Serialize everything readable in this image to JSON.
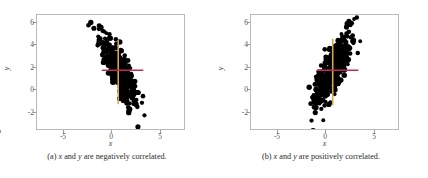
{
  "figure": {
    "panels": [
      {
        "tag": "(a)",
        "caption_pre": "(a) ",
        "caption_var1": "x",
        "caption_mid": " and ",
        "caption_var2": "y",
        "caption_post": " are negatively correlated.",
        "caption_full": "(a) x and y are negatively correlated.",
        "xlabel": "x",
        "ylabel": "y",
        "xticks": [
          "-5",
          "0",
          "5"
        ],
        "yticks": [
          "6",
          "4",
          "2",
          "0",
          "-2"
        ],
        "vline_color": "#d9a84e",
        "hline_color": "#c12b5a",
        "point_color": "#000000"
      },
      {
        "tag": "(b)",
        "caption_pre": "(b) ",
        "caption_var1": "x",
        "caption_mid": " and ",
        "caption_var2": "y",
        "caption_post": " are positively correlated.",
        "caption_full": "(b) x and y are positively correlated.",
        "xlabel": "x",
        "ylabel": "y",
        "xticks": [
          "-5",
          "0",
          "5"
        ],
        "yticks": [
          "6",
          "4",
          "2",
          "0",
          "-2"
        ],
        "vline_color": "#d9a84e",
        "hline_color": "#c12b5a",
        "point_color": "#000000"
      }
    ]
  },
  "chart_data": [
    {
      "type": "scatter",
      "title": "",
      "subtitle": "(a) x and y are negatively correlated.",
      "xlabel": "x",
      "ylabel": "y",
      "xlim": [
        -7.6,
        7.6
      ],
      "ylim": [
        -3.2,
        6.9
      ],
      "xticks": [
        -5,
        0,
        5
      ],
      "yticks": [
        -2,
        0,
        2,
        4,
        6
      ],
      "grid": false,
      "legend": "none",
      "correlation_sign": "negative",
      "approx_correlation": -0.75,
      "n_points": 420,
      "mean_x": 0.8,
      "mean_y": 2.0,
      "annotations": [
        {
          "kind": "vline",
          "x": 0.8,
          "y_from": -1.0,
          "y_to": 4.7,
          "color": "#d9a84e"
        },
        {
          "kind": "hline",
          "y": 2.0,
          "x_from": -0.9,
          "x_to": 3.4,
          "color": "#c12b5a"
        }
      ],
      "x": [
        -1.55,
        -1.32,
        -1.18,
        -1.05,
        -0.95,
        -0.88,
        -0.8,
        -0.72,
        -0.65,
        -0.6,
        -0.55,
        -0.5,
        -0.45,
        -0.4,
        -0.36,
        -0.32,
        -0.28,
        -0.24,
        -0.2,
        -0.16,
        -0.12,
        -0.08,
        -0.04,
        0.0,
        0.04,
        0.08,
        0.12,
        0.16,
        0.2,
        0.24,
        0.28,
        0.32,
        0.36,
        0.4,
        0.44,
        0.48,
        0.52,
        0.56,
        0.6,
        0.64,
        0.68,
        0.72,
        0.76,
        0.8,
        0.84,
        0.88,
        0.92,
        0.96,
        1.0,
        1.04,
        1.08,
        1.12,
        1.16,
        1.2,
        1.24,
        1.28,
        1.32,
        1.36,
        1.4,
        1.44,
        1.48,
        1.52,
        1.56,
        1.6,
        1.65,
        1.7,
        1.75,
        1.8,
        1.85,
        1.9,
        1.95,
        2.0,
        2.1,
        2.2,
        2.3,
        2.4,
        2.5,
        2.65,
        2.8,
        3.0,
        3.2,
        3.5,
        3.8,
        4.1,
        -1.45,
        -1.2,
        -1.0,
        -0.85,
        -0.7,
        -0.58,
        -0.48,
        -0.38,
        -0.3,
        -0.22,
        -0.14,
        -0.06,
        0.02,
        0.1,
        0.18,
        0.26,
        0.34,
        0.42,
        0.5,
        0.58,
        0.66,
        0.74,
        0.82,
        0.9,
        0.98,
        1.06,
        1.14,
        1.22,
        1.3,
        1.38,
        1.46,
        1.54,
        1.62,
        1.72,
        1.82,
        1.92,
        2.05,
        2.15,
        2.25,
        2.35,
        2.45,
        2.6,
        2.75,
        2.95,
        3.15,
        3.4,
        3.7,
        4.0
      ],
      "y": [
        4.8,
        4.3,
        4.6,
        4.1,
        3.9,
        4.4,
        3.6,
        4.0,
        3.4,
        3.8,
        3.2,
        3.6,
        4.2,
        3.0,
        3.5,
        2.8,
        3.3,
        4.0,
        2.6,
        3.1,
        3.7,
        2.4,
        2.9,
        3.5,
        2.2,
        2.7,
        3.3,
        2.0,
        2.5,
        3.1,
        1.8,
        2.3,
        2.9,
        1.6,
        2.1,
        2.7,
        1.4,
        1.9,
        2.5,
        1.2,
        1.7,
        2.3,
        1.0,
        1.5,
        2.1,
        0.8,
        1.3,
        1.9,
        0.6,
        1.1,
        1.7,
        0.4,
        0.9,
        1.5,
        0.2,
        0.7,
        1.3,
        0.0,
        0.5,
        1.1,
        -0.2,
        0.3,
        0.9,
        -0.4,
        0.1,
        0.7,
        -0.6,
        -0.1,
        0.5,
        -0.8,
        -0.3,
        0.3,
        -0.5,
        0.1,
        -0.7,
        -0.1,
        -0.9,
        -0.3,
        -1.1,
        -0.5,
        -1.3,
        -1.6,
        -2.0,
        -2.3,
        5.2,
        5.5,
        4.9,
        4.5,
        5.0,
        4.2,
        4.7,
        3.9,
        4.4,
        3.7,
        4.2,
        3.5,
        4.0,
        3.3,
        3.8,
        3.1,
        3.6,
        2.9,
        3.4,
        2.7,
        3.2,
        2.5,
        3.0,
        2.3,
        2.8,
        2.1,
        2.6,
        1.9,
        2.4,
        1.7,
        2.2,
        1.5,
        2.0,
        1.3,
        1.6,
        1.1,
        1.4,
        0.8,
        1.2,
        0.5,
        0.9,
        0.2,
        0.6,
        -0.1,
        0.2,
        -0.4,
        -0.8,
        -0.6
      ]
    },
    {
      "type": "scatter",
      "title": "",
      "subtitle": "(b) x and y are positively correlated.",
      "xlabel": "x",
      "ylabel": "y",
      "xlim": [
        -7.6,
        7.6
      ],
      "ylim": [
        -3.2,
        6.9
      ],
      "xticks": [
        -5,
        0,
        5
      ],
      "yticks": [
        -2,
        0,
        2,
        4,
        6
      ],
      "grid": false,
      "legend": "none",
      "correlation_sign": "positive",
      "approx_correlation": 0.75,
      "n_points": 420,
      "mean_x": 0.85,
      "mean_y": 2.0,
      "annotations": [
        {
          "kind": "vline",
          "x": 0.85,
          "y_from": -1.1,
          "y_to": 4.8,
          "color": "#d9a84e"
        },
        {
          "kind": "hline",
          "y": 2.0,
          "x_from": -0.8,
          "x_to": 3.5,
          "color": "#c12b5a"
        }
      ],
      "x": [
        -1.55,
        -1.32,
        -1.18,
        -1.05,
        -0.95,
        -0.88,
        -0.8,
        -0.72,
        -0.65,
        -0.6,
        -0.55,
        -0.5,
        -0.45,
        -0.4,
        -0.36,
        -0.32,
        -0.28,
        -0.24,
        -0.2,
        -0.16,
        -0.12,
        -0.08,
        -0.04,
        0.0,
        0.04,
        0.08,
        0.12,
        0.16,
        0.2,
        0.24,
        0.28,
        0.32,
        0.36,
        0.4,
        0.44,
        0.48,
        0.52,
        0.56,
        0.6,
        0.64,
        0.68,
        0.72,
        0.76,
        0.8,
        0.84,
        0.88,
        0.92,
        0.96,
        1.0,
        1.04,
        1.08,
        1.12,
        1.16,
        1.2,
        1.24,
        1.28,
        1.32,
        1.36,
        1.4,
        1.44,
        1.48,
        1.52,
        1.56,
        1.6,
        1.65,
        1.7,
        1.75,
        1.8,
        1.85,
        1.9,
        1.95,
        2.0,
        2.1,
        2.2,
        2.3,
        2.4,
        2.5,
        2.65,
        2.8,
        3.0,
        3.2,
        3.5,
        3.8,
        4.1,
        -1.45,
        -1.2,
        -1.0,
        -0.85,
        -0.7,
        -0.58,
        -0.48,
        -0.38,
        -0.3,
        -0.22,
        -0.14,
        -0.06,
        0.02,
        0.1,
        0.18,
        0.26,
        0.34,
        0.42,
        0.5,
        0.58,
        0.66,
        0.74,
        0.82,
        0.9,
        0.98,
        1.06,
        1.14,
        1.22,
        1.3,
        1.38,
        1.46,
        1.54,
        1.62,
        1.72,
        1.82,
        1.92,
        2.05,
        2.15,
        2.25,
        2.35,
        2.45,
        2.6,
        2.75,
        2.95,
        3.15,
        3.4,
        3.7,
        4.0
      ],
      "y": [
        -0.9,
        -0.6,
        -0.3,
        -0.1,
        0.2,
        -0.5,
        0.5,
        0.0,
        0.8,
        0.3,
        1.1,
        0.6,
        -0.2,
        1.4,
        0.9,
        1.7,
        1.2,
        0.4,
        2.0,
        1.5,
        0.8,
        2.3,
        1.8,
        1.1,
        2.6,
        2.1,
        1.4,
        2.9,
        2.4,
        1.7,
        3.2,
        2.7,
        2.0,
        3.5,
        3.0,
        2.3,
        3.8,
        3.3,
        2.6,
        4.1,
        3.6,
        2.9,
        4.4,
        3.9,
        3.2,
        4.7,
        4.2,
        3.5,
        5.0,
        4.5,
        3.8,
        5.3,
        4.8,
        4.1,
        5.6,
        5.1,
        4.4,
        5.9,
        5.4,
        4.7,
        6.1,
        5.6,
        4.9,
        5.8,
        5.1,
        5.3,
        5.5,
        4.6,
        5.0,
        5.7,
        4.8,
        5.2,
        5.4,
        5.0,
        5.6,
        5.2,
        5.8,
        5.4,
        5.6,
        5.8,
        5.5,
        5.9,
        5.7,
        5.8,
        -1.8,
        -2.2,
        -1.5,
        -1.2,
        -1.6,
        -0.9,
        -1.3,
        -0.6,
        -1.0,
        -0.4,
        -0.7,
        -0.1,
        -0.5,
        0.2,
        -0.2,
        0.5,
        0.1,
        0.8,
        0.4,
        1.1,
        0.7,
        1.4,
        1.0,
        1.7,
        1.3,
        2.0,
        1.6,
        2.3,
        1.9,
        2.6,
        2.2,
        2.9,
        2.5,
        3.2,
        3.6,
        3.9,
        3.4,
        4.2,
        3.8,
        4.5,
        4.1,
        4.8,
        4.4,
        5.1,
        4.7,
        5.4,
        5.0,
        5.3
      ]
    }
  ]
}
